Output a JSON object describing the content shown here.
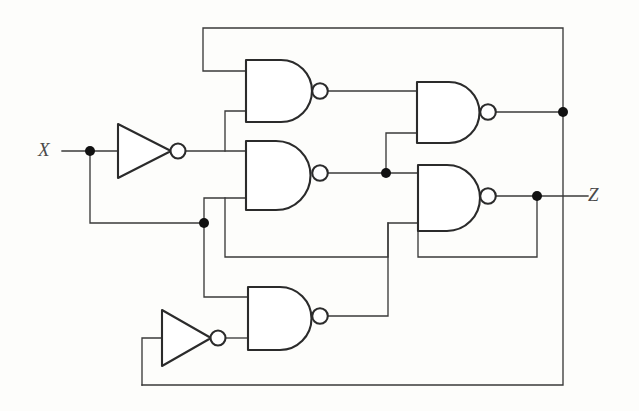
{
  "diagram": {
    "type": "logic-circuit-schematic",
    "line_color": "#3a3a3a",
    "gate_stroke_color": "#2b2b2b",
    "background_color": "#fdfdfb",
    "dot_color": "#111111"
  },
  "labels": {
    "input_x": "X",
    "output_z": "Z"
  },
  "ports": [
    {
      "name": "input-x",
      "label": "X",
      "x": 62,
      "y": 151
    },
    {
      "name": "output-z",
      "label": "Z",
      "x": 588,
      "y": 196
    }
  ],
  "gates": [
    {
      "id": "inv1",
      "kind": "inverter",
      "label": "NOT",
      "x": 118,
      "y": 124,
      "w": 54,
      "h": 54
    },
    {
      "id": "inv2",
      "kind": "inverter",
      "label": "NOT",
      "x": 162,
      "y": 310,
      "w": 50,
      "h": 56
    },
    {
      "id": "nand1",
      "kind": "nand",
      "label": "NAND",
      "x": 246,
      "y": 60,
      "w": 66,
      "h": 62
    },
    {
      "id": "nand2",
      "kind": "nand",
      "label": "NAND",
      "x": 246,
      "y": 141,
      "w": 64,
      "h": 69
    },
    {
      "id": "nand3",
      "kind": "nand",
      "label": "NAND",
      "x": 417,
      "y": 82,
      "w": 63,
      "h": 61
    },
    {
      "id": "nand4",
      "kind": "nand",
      "label": "NAND",
      "x": 418,
      "y": 165,
      "w": 62,
      "h": 66
    },
    {
      "id": "nand5",
      "kind": "nand",
      "label": "NAND",
      "x": 248,
      "y": 287,
      "w": 64,
      "h": 63
    }
  ],
  "junctions": [
    {
      "name": "junction-x-split",
      "x": 90,
      "y": 151
    },
    {
      "name": "junction-x-lower",
      "x": 204,
      "y": 223
    },
    {
      "name": "junction-nand2-output",
      "x": 386,
      "y": 173
    },
    {
      "name": "junction-nand3-output",
      "x": 563,
      "y": 112
    },
    {
      "name": "junction-nand4-output",
      "x": 537,
      "y": 196
    }
  ],
  "nets": [
    {
      "name": "net-x-input",
      "from": "X",
      "to": "inv1 input"
    },
    {
      "name": "net-x-feedback-down",
      "from": "X",
      "to": "nand2 / nand5 inputs"
    },
    {
      "name": "net-inv1-out",
      "from": "inv1",
      "to": "nand1 / nand2 inputs"
    },
    {
      "name": "net-nand1-out",
      "from": "nand1",
      "to": "nand3 upper input"
    },
    {
      "name": "net-nand2-out",
      "from": "nand2",
      "to": "nand3 lower / nand4 upper inputs"
    },
    {
      "name": "net-nand3-out",
      "from": "nand3",
      "to": "top feedback to nand1 upper input"
    },
    {
      "name": "net-nand4-out",
      "from": "nand4",
      "to": "Z and bottom feedback"
    },
    {
      "name": "net-nand5-out",
      "from": "nand5",
      "to": "nand4 lower input"
    },
    {
      "name": "net-inv2-out",
      "from": "inv2",
      "to": "nand5 lower input"
    },
    {
      "name": "net-bottom-feedback",
      "from": "nand3",
      "to": "inv2 input"
    }
  ]
}
